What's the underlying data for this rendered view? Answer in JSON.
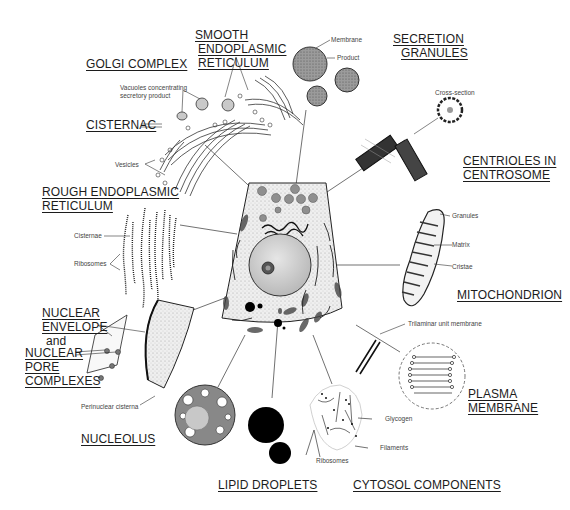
{
  "labels": {
    "smooth_er": [
      "SMOOTH",
      "ENDOPLASMIC",
      "RETICULUM"
    ],
    "golgi": "GOLGI COMPLEX",
    "secretion": [
      "SECRETION",
      "GRANULES"
    ],
    "cisternac": "CISTERNAC",
    "centrioles": [
      "CENTRIOLES IN",
      "CENTROSOME"
    ],
    "rough_er": [
      "ROUGH ENDOPLASMIC",
      "RETICULUM"
    ],
    "mitochondrion": "MITOCHONDRION",
    "nuclear_envelope": [
      "NUCLEAR",
      "ENVELOPE"
    ],
    "and": "and",
    "nuclear_pore": [
      "NUCLEAR",
      "PORE",
      "COMPLEXES"
    ],
    "plasma_membrane": [
      "PLASMA",
      "MEMBRANE"
    ],
    "nucleolus": "NUCLEOLUS",
    "lipid": "LIPID DROPLETS",
    "cytosol": "CYTOSOL COMPONENTS"
  },
  "sublabels": {
    "vacuoles": [
      "Vacuoles concentrating",
      "secretory product"
    ],
    "vesicles": "Vesicles",
    "membrane": "Membrane",
    "product": "Product",
    "cross_section": "Cross-section",
    "cisternae": "Cisternae",
    "ribosomes_rer": "Ribosomes",
    "granules": "Granules",
    "matrix": "Matrix",
    "cristae": "Cristae",
    "trilaminar": "Trilaminar unit membrane",
    "perinuclear": "Perinuclear cisterna",
    "glycogen": "Glycogen",
    "filaments": "Filaments",
    "ribosomes_cyt": "Ribosomes"
  },
  "colors": {
    "ink": "#1a1a1a",
    "granule": "#8a8a8a",
    "cytoplasm": "#ececec",
    "nucleus": "#d6d6d6",
    "lipid": "#000000"
  }
}
